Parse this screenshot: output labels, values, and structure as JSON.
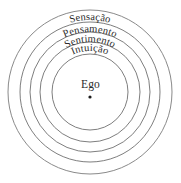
{
  "diagram": {
    "center_label": "Ego",
    "center_dot": "center-point-marker",
    "stroke_color": "#6f6f6f",
    "background_color": "#ffffff",
    "text_color": "#2b2b2b",
    "rings": [
      {
        "index": 1,
        "label": "Sensação",
        "radius": 82,
        "label_radius": 72,
        "label_y": 20
      },
      {
        "index": 2,
        "label": "Pensamento",
        "radius": 70,
        "label_radius": 60,
        "label_y": 33
      },
      {
        "index": 3,
        "label": "Sentimento",
        "radius": 60,
        "label_radius": 50,
        "label_y": 45
      },
      {
        "index": 4,
        "label": "Intuição",
        "radius": 50,
        "label_radius": 41,
        "label_y": 56
      },
      {
        "index": 5,
        "label": "",
        "radius": 38,
        "label_radius": 0,
        "label_y": 0
      }
    ],
    "geometry": {
      "center_x": 90,
      "center_y": 92,
      "width": 181,
      "height": 183
    }
  }
}
